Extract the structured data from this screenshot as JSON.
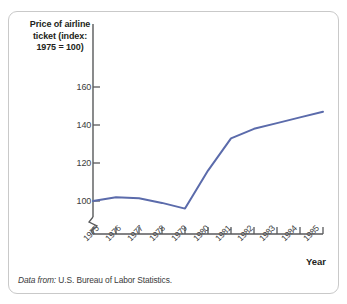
{
  "figure": {
    "y_axis_title": "Price of airline ticket (index: 1975 = 100)",
    "y_axis_title_lines": [
      "Price of airline",
      "ticket (index:",
      "1975 = 100)"
    ],
    "x_axis_title": "Year",
    "source_prefix": "Data from:",
    "source_text": "U.S. Bureau of Labor Statistics.",
    "line_color": "#5b6bab",
    "axis_color": "#58595b",
    "border_color": "#c9c9c9"
  },
  "chart_data": {
    "type": "line",
    "title": "",
    "xlabel": "Year",
    "ylabel": "Price of airline ticket (index: 1975 = 100)",
    "x": [
      1975,
      1976,
      1977,
      1978,
      1979,
      1980,
      1981,
      1982,
      1983,
      1984,
      1985
    ],
    "categories": [
      "1975",
      "1976",
      "1977",
      "1978",
      "1979",
      "1980",
      "1981",
      "1982",
      "1983",
      "1984",
      "1985"
    ],
    "values": [
      100,
      102,
      101.5,
      99,
      96,
      116,
      133,
      138,
      141,
      144,
      147
    ],
    "series": [
      {
        "name": "Price of airline ticket (index: 1975 = 100)",
        "values": [
          100,
          102,
          101.5,
          99,
          96,
          116,
          133,
          138,
          141,
          144,
          147
        ]
      }
    ],
    "ytick_labels": [
      "160",
      "140",
      "120",
      "100"
    ],
    "yticks": [
      160,
      140,
      120,
      100
    ],
    "ylim": [
      90,
      170
    ],
    "xlim": [
      1975,
      1985
    ],
    "grid": false,
    "legend": "none",
    "axis_break": true
  }
}
